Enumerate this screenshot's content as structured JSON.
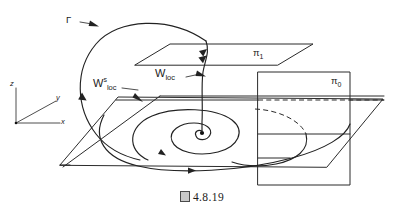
{
  "figure": {
    "caption_marker": "figure-box-glyph",
    "caption_text": "4.8.19",
    "caption_full": "図 4.8.19"
  },
  "axes": {
    "origin_label": "",
    "z_label": "z",
    "y_label": "y",
    "x_label": "x"
  },
  "labels": {
    "gamma": "Γ",
    "w_stable_base": "W",
    "w_stable_sup": "s",
    "w_stable_sub": "loc",
    "w_loc_base": "W",
    "w_loc_sub": "loc",
    "pi_one_base": "π",
    "pi_one_sub": "1",
    "pi_zero_base": "π",
    "pi_zero_sub": "0"
  },
  "colors": {
    "ink": "#2b2b2b",
    "background": "#ffffff",
    "fixed_point": "#111111"
  },
  "elements": {
    "fixed_point_name": "equilibrium point",
    "spiral_name": "stable spiral on base plane",
    "homoclinic_name": "homoclinic orbit"
  }
}
